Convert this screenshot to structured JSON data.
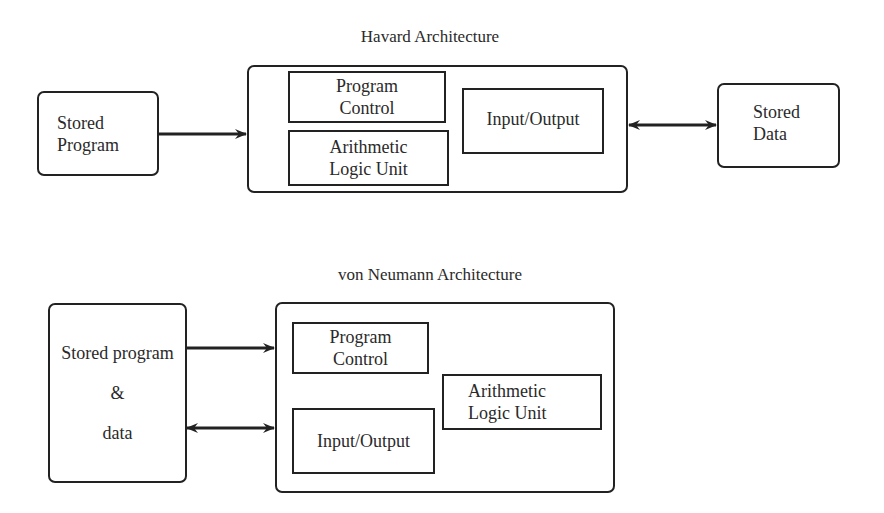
{
  "harvard": {
    "title": "Havard Architecture",
    "stored_program": {
      "line1": "Stored",
      "line2": "Program"
    },
    "program_control": {
      "line1": "Program",
      "line2": "Control"
    },
    "alu": {
      "line1": "Arithmetic",
      "line2": "Logic Unit"
    },
    "io": {
      "label": "Input/Output"
    },
    "stored_data": {
      "line1": "Stored",
      "line2": "Data"
    }
  },
  "von_neumann": {
    "title": "von Neumann Architecture",
    "stored": {
      "line1": "Stored program",
      "line2": "&",
      "line3": "data"
    },
    "program_control": {
      "line1": "Program",
      "line2": "Control"
    },
    "alu": {
      "line1": "Arithmetic",
      "line2": "Logic Unit"
    },
    "io": {
      "label": "Input/Output"
    }
  },
  "colors": {
    "stroke": "#222222",
    "text": "#2a2a2a",
    "background": "#ffffff"
  }
}
